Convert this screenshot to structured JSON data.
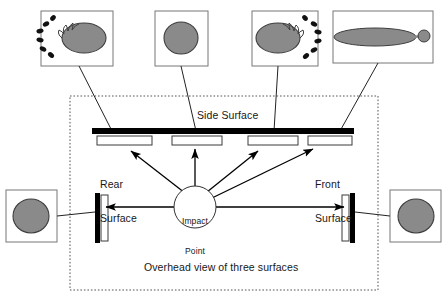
{
  "figure": {
    "title": "Overhead view of three surfaces"
  },
  "labels": {
    "side_surface": "Side Surface",
    "rear_surface": "Rear\nSurface",
    "front_surface": "Front\nSurface",
    "overhead_view": "Overhead view of three surfaces",
    "impact_point": "Impact\nPoint"
  },
  "impact_point": {
    "line1": "Impact",
    "line2": "Point",
    "cx": 195,
    "cy": 207,
    "r": 21
  },
  "colors": {
    "stain_fill": "#8a8a8a",
    "stain_stroke": "#3d3d3d",
    "satellite_fill": "#111111",
    "wall_stroke": "#000000",
    "dotted_border": "#555555",
    "callout_border": "#777777",
    "leader_line": "#222222",
    "arrow": "#000000",
    "text": "#171717",
    "background": "#ffffff"
  },
  "dotted_boundary": {
    "x": 70,
    "y": 96,
    "width": 308,
    "height": 194
  },
  "surfaces": {
    "side": {
      "x": 92,
      "y": 128,
      "width": 262,
      "height": 6,
      "orientation": "horizontal",
      "name": "Side Surface"
    },
    "rear": {
      "x": 95,
      "y": 193,
      "width": 5,
      "height": 50,
      "orientation": "vertical",
      "name": "Rear Surface"
    },
    "front": {
      "x": 350,
      "y": 193,
      "width": 5,
      "height": 50,
      "orientation": "vertical",
      "name": "Front Surface"
    }
  },
  "target_strips": [
    {
      "name": "strip-1",
      "x": 97,
      "y": 136,
      "width": 55,
      "height": 9,
      "surface": "side"
    },
    {
      "name": "strip-2",
      "x": 172,
      "y": 136,
      "width": 50,
      "height": 9,
      "surface": "side"
    },
    {
      "name": "strip-3",
      "x": 248,
      "y": 136,
      "width": 50,
      "height": 9,
      "surface": "side"
    },
    {
      "name": "strip-4",
      "x": 308,
      "y": 136,
      "width": 44,
      "height": 9,
      "surface": "side"
    },
    {
      "name": "strip-rear",
      "x": 101,
      "y": 195,
      "width": 7,
      "height": 46,
      "surface": "rear"
    },
    {
      "name": "strip-front",
      "x": 342,
      "y": 195,
      "width": 7,
      "height": 46,
      "surface": "front"
    }
  ],
  "callouts": [
    {
      "id": "callout-1",
      "stain_type": "elongated-with-satellite-spatter-left",
      "box": {
        "x": 41,
        "y": 11,
        "width": 72,
        "height": 55
      },
      "stain": {
        "cx": 84,
        "cy": 38,
        "rx": 22,
        "ry": 15,
        "rotation": 0
      },
      "satellites": [
        {
          "cx": 46,
          "cy": 24,
          "rx": 3.4,
          "ry": 2.4,
          "rot": -30
        },
        {
          "cx": 40,
          "cy": 31,
          "rx": 3.6,
          "ry": 2.3,
          "rot": -12
        },
        {
          "cx": 40,
          "cy": 40,
          "rx": 3.6,
          "ry": 2.3,
          "rot": 10
        },
        {
          "cx": 43,
          "cy": 49,
          "rx": 3.5,
          "ry": 2.3,
          "rot": 28
        },
        {
          "cx": 51,
          "cy": 55,
          "rx": 3.4,
          "ry": 2.4,
          "rot": 40
        },
        {
          "cx": 53,
          "cy": 18,
          "rx": 3.2,
          "ry": 2.3,
          "rot": -45
        }
      ],
      "leader": {
        "x1": 79,
        "y1": 66,
        "x2": 112,
        "y2": 131
      }
    },
    {
      "id": "callout-2",
      "stain_type": "circular-90-degree-impact",
      "box": {
        "x": 155,
        "y": 11,
        "width": 53,
        "height": 55
      },
      "stain": {
        "cx": 181,
        "cy": 38,
        "rx": 17,
        "ry": 16,
        "rotation": 0
      },
      "satellites": [],
      "leader": {
        "x1": 181,
        "y1": 66,
        "x2": 196,
        "y2": 131
      }
    },
    {
      "id": "callout-3",
      "stain_type": "elongated-with-satellite-spatter-right",
      "box": {
        "x": 252,
        "y": 11,
        "width": 66,
        "height": 55
      },
      "stain": {
        "cx": 278,
        "cy": 38,
        "rx": 22,
        "ry": 15,
        "rotation": 0
      },
      "satellites": [
        {
          "cx": 314,
          "cy": 24,
          "rx": 3.4,
          "ry": 2.4,
          "rot": 30
        },
        {
          "cx": 318,
          "cy": 32,
          "rx": 3.6,
          "ry": 2.3,
          "rot": 12
        },
        {
          "cx": 318,
          "cy": 41,
          "rx": 3.6,
          "ry": 2.3,
          "rot": -10
        },
        {
          "cx": 314,
          "cy": 50,
          "rx": 3.5,
          "ry": 2.3,
          "rot": -28
        },
        {
          "cx": 306,
          "cy": 56,
          "rx": 3.4,
          "ry": 2.4,
          "rot": -40
        },
        {
          "cx": 305,
          "cy": 18,
          "rx": 3.2,
          "ry": 2.3,
          "rot": 45
        }
      ],
      "leader": {
        "x1": 278,
        "y1": 66,
        "x2": 274,
        "y2": 131
      }
    },
    {
      "id": "callout-4",
      "stain_type": "highly-elongated-with-tail-and-detached-droplet",
      "box": {
        "x": 333,
        "y": 11,
        "width": 100,
        "height": 52
      },
      "stain": {
        "cx": 375,
        "cy": 37,
        "rx": 41,
        "ry": 9,
        "rotation": 0
      },
      "tail": {
        "x1": 414,
        "y1": 37,
        "x2": 421,
        "y2": 36
      },
      "droplet": {
        "cx": 424,
        "cy": 36,
        "r": 6
      },
      "satellites": [],
      "leader": {
        "x1": 378,
        "y1": 63,
        "x2": 340,
        "y2": 131
      }
    },
    {
      "id": "callout-left",
      "stain_type": "circular-perpendicular-rear",
      "box": {
        "x": 6,
        "y": 190,
        "width": 51,
        "height": 52
      },
      "stain": {
        "cx": 31,
        "cy": 216,
        "rx": 18,
        "ry": 17,
        "rotation": 0
      },
      "satellites": [],
      "leader": {
        "x1": 57,
        "y1": 216,
        "x2": 95,
        "y2": 212
      }
    },
    {
      "id": "callout-right",
      "stain_type": "circular-perpendicular-front",
      "box": {
        "x": 390,
        "y": 190,
        "width": 51,
        "height": 52
      },
      "stain": {
        "cx": 416,
        "cy": 216,
        "rx": 18,
        "ry": 17,
        "rotation": 0
      },
      "satellites": [],
      "leader": {
        "x1": 390,
        "y1": 216,
        "x2": 355,
        "y2": 212
      }
    }
  ],
  "trajectory_arrows": [
    {
      "name": "arrow-to-strip-1",
      "x1": 185,
      "y1": 193,
      "x2": 130,
      "y2": 150,
      "target": "strip-1"
    },
    {
      "name": "arrow-to-strip-2",
      "x1": 195,
      "y1": 188,
      "x2": 195,
      "y2": 148,
      "target": "strip-2"
    },
    {
      "name": "arrow-to-strip-3",
      "x1": 207,
      "y1": 192,
      "x2": 259,
      "y2": 150,
      "target": "strip-3"
    },
    {
      "name": "arrow-to-strip-4",
      "x1": 212,
      "y1": 198,
      "x2": 314,
      "y2": 148,
      "target": "strip-4"
    },
    {
      "name": "arrow-to-rear",
      "x1": 174,
      "y1": 207,
      "x2": 104,
      "y2": 207,
      "target": "strip-rear"
    },
    {
      "name": "arrow-to-front",
      "x1": 216,
      "y1": 207,
      "x2": 346,
      "y2": 207,
      "target": "strip-front"
    }
  ]
}
